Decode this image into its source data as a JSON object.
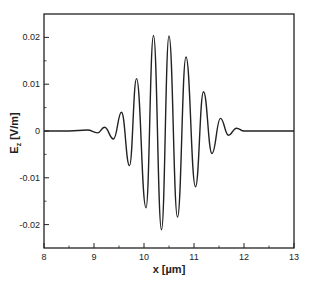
{
  "chart_data": {
    "type": "line",
    "title": "",
    "xlabel": "x [µm]",
    "ylabel": "E_z [V/m]",
    "ylabel_main": "E",
    "ylabel_sub": "z",
    "ylabel_unit": " [V/m]",
    "xlim": [
      8,
      13
    ],
    "ylim": [
      -0.025,
      0.025
    ],
    "grid": false,
    "legend": null,
    "xticks": [
      8,
      9,
      10,
      11,
      12,
      13
    ],
    "xtick_labels": [
      "8",
      "9",
      "10",
      "11",
      "12",
      "13"
    ],
    "xminor": [
      8.5,
      9.5,
      10.5,
      11.5,
      12.5
    ],
    "yticks": [
      0.02,
      0.01,
      0,
      -0.01,
      -0.02
    ],
    "ytick_labels": [
      "0.02",
      "0.01",
      "0",
      "-0.01",
      "-0.02"
    ],
    "yminor": [
      0.015,
      0.005,
      -0.005,
      -0.015
    ],
    "line_color": "#222222",
    "series": [
      {
        "name": "E_z",
        "points": [
          [
            8.0,
            0.0
          ],
          [
            8.5,
            0.0
          ],
          [
            8.87,
            0.0002
          ],
          [
            9.07,
            -0.0004
          ],
          [
            9.21,
            0.0008
          ],
          [
            9.39,
            -0.0017
          ],
          [
            9.55,
            0.004
          ],
          [
            9.71,
            -0.0074
          ],
          [
            9.85,
            0.0112
          ],
          [
            10.04,
            -0.0164
          ],
          [
            10.19,
            0.0204
          ],
          [
            10.35,
            -0.0211
          ],
          [
            10.5,
            0.0203
          ],
          [
            10.67,
            -0.0184
          ],
          [
            10.84,
            0.0158
          ],
          [
            11.03,
            -0.0119
          ],
          [
            11.19,
            0.0084
          ],
          [
            11.36,
            -0.0048
          ],
          [
            11.53,
            0.0027
          ],
          [
            11.69,
            -0.0009
          ],
          [
            11.85,
            0.0006
          ],
          [
            12.0,
            0.0
          ],
          [
            13.0,
            0.0
          ]
        ]
      }
    ]
  }
}
